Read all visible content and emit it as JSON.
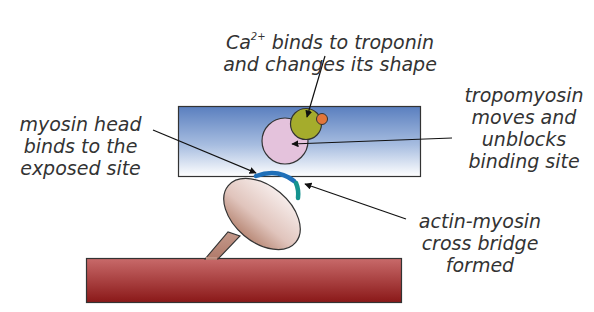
{
  "labels": {
    "calcium": {
      "prefix": "Ca",
      "superscript": "2+",
      "line1_rest": " binds to troponin",
      "line2": "and changes its shape"
    },
    "tropomyosin": {
      "line1": "tropomyosin",
      "line2": "moves and",
      "line3": "unblocks",
      "line4": "binding site"
    },
    "myosin_head": {
      "line1": "myosin head",
      "line2": "binds to the",
      "line3": "exposed site"
    },
    "cross_bridge": {
      "line1": "actin-myosin",
      "line2": "cross bridge",
      "line3": "formed"
    }
  },
  "colors": {
    "actin_filament_top": "#5a7fbf",
    "actin_filament_bottom": "#ffffff",
    "tropomyosin": "#e4c2dc",
    "troponin": "#a5ac2c",
    "calcium": "#e2763a",
    "myosin_head_top": "#f4e8e4",
    "myosin_head_bottom": "#b0806e",
    "myosin_filament_top": "#c86060",
    "myosin_filament_bottom": "#8c1a1a",
    "binding_site": "#1f6fb8",
    "cross_bridge_site": "#15938f",
    "text": "#333333"
  }
}
